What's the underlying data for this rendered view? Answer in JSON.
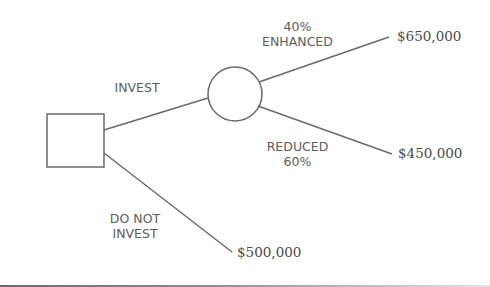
{
  "diagram": {
    "type": "decision-tree",
    "nodes": {
      "decision": {
        "shape": "square"
      },
      "chance": {
        "shape": "circle"
      }
    },
    "branches": {
      "invest": {
        "label": "INVEST"
      },
      "do_not_invest": {
        "label_line1": "DO NOT",
        "label_line2": "INVEST",
        "outcome": "$500,000"
      },
      "enhanced": {
        "probability": "40%",
        "label": "ENHANCED",
        "outcome": "$650,000"
      },
      "reduced": {
        "label": "REDUCED",
        "probability": "60%",
        "outcome": "$450,000"
      }
    },
    "colors": {
      "stroke": "#6a6a6a",
      "text": "#5c5c5c",
      "background": "#ffffff"
    }
  }
}
